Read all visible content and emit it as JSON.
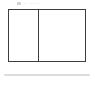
{
  "window": {
    "background_color": "#ffffff"
  },
  "toolbar": {
    "icon_name": "menu-icon",
    "label": "File",
    "secondary_label": "Edit View"
  },
  "document": {
    "frame": {
      "border_color": "#3d3d3d",
      "fill_color": "#ffffff",
      "left_pane_label": "",
      "right_pane_label": ""
    },
    "caption": ""
  },
  "divider": {
    "name": "horizontal-rule",
    "color": "#dcdcdc"
  }
}
